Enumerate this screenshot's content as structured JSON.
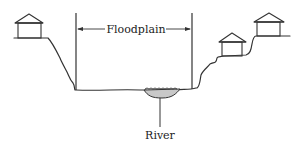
{
  "diagram": {
    "labels": {
      "floodplain": "Floodplain",
      "river": "River"
    },
    "elements": {
      "houses": [
        {
          "id": "house-left",
          "position": "upper-left bank"
        },
        {
          "id": "house-right-lower",
          "position": "right bank, lower terrace"
        },
        {
          "id": "house-right-upper",
          "position": "right bank, upper terrace"
        }
      ],
      "river": {
        "fill": "#c8c8c8"
      },
      "floodplain_bounds": "vertical lines marking extent of floodplain"
    },
    "colors": {
      "line": "#333333",
      "river_fill": "#c8c8c8",
      "background": "#ffffff"
    }
  }
}
